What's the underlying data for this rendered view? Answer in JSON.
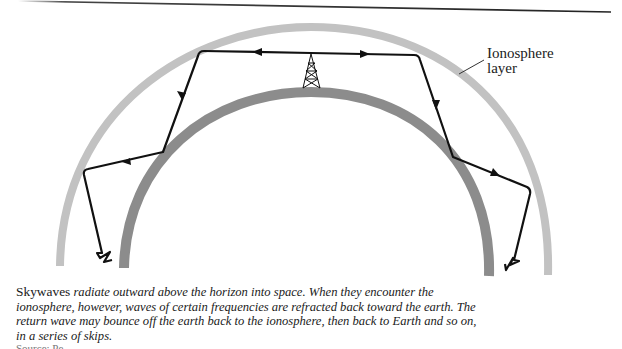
{
  "figure": {
    "rule_color": "#2a2a2a",
    "ionosphere_color": "#c2c2c2",
    "earth_color": "#8c8c8c",
    "wave_color": "#111111",
    "label": {
      "line1": "Ionosphere",
      "line2": "layer"
    },
    "elements": [
      {
        "name": "ionosphere-arc",
        "description": "Outer light gray arc"
      },
      {
        "name": "earth-arc",
        "description": "Inner dark gray arc"
      },
      {
        "name": "transmitter-tower-icon",
        "description": "Lattice radio tower at top of earth arc"
      },
      {
        "name": "skywave-path-left",
        "description": "Wave travels left, bounces between ionosphere and earth, ends in zigzag"
      },
      {
        "name": "skywave-path-right",
        "description": "Wave travels right, bounces between ionosphere and earth, ends in zigzag"
      }
    ]
  },
  "caption": {
    "lead": "Skywaves",
    "body": " radiate outward above the horizon into space. When they encounter the ionosphere, however, waves of certain frequencies are refracted back toward the earth. The return wave may bounce off the earth back to the ionosphere, then back to Earth and so on, in a series of skips."
  },
  "source": {
    "text": "Source: Pe..."
  }
}
